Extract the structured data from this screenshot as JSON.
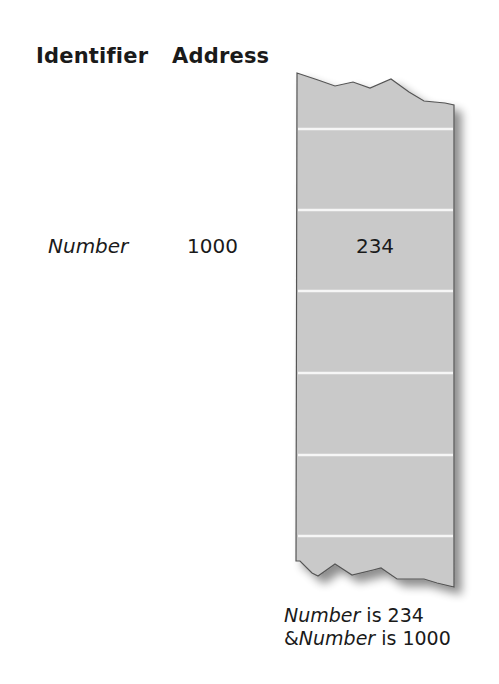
{
  "headers": {
    "identifier": "Identifier",
    "address": "Address"
  },
  "variable": {
    "name": "Number",
    "address": "1000",
    "value": "234"
  },
  "memory": {
    "cell_count": 6,
    "fill_color": "#c8c8c8",
    "divider_color": "#f4f4f4"
  },
  "caption": {
    "line1_name": "Number",
    "line1_rest": " is 234",
    "line2_prefix": "&",
    "line2_name": "Number",
    "line2_rest": " is 1000"
  }
}
